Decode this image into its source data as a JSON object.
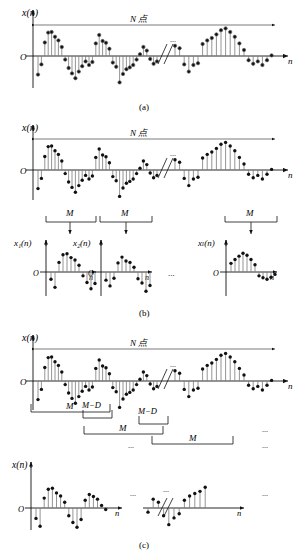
{
  "figure": {
    "title_note": "Segmentation of an N-point sequence x(n)",
    "axis": {
      "signal_label": "x(n)",
      "origin_label": "O",
      "time_label": "n",
      "ellipsis": "...",
      "break_symbol": "//"
    },
    "labels": {
      "n_points": "N 点",
      "M": "M",
      "M_minus_D": "M−D",
      "x1": "x₁(n)",
      "x2": "x₂(n)",
      "xL": "xₗ(n)",
      "x1_sub": "1",
      "x2_sub": "2",
      "xL_sub": "L"
    },
    "captions": {
      "a": "(a)",
      "b": "(b)",
      "c": "(c)"
    }
  },
  "chart_data": {
    "type": "line",
    "xlabel": "n",
    "ylabel": "x(n)",
    "grid": false,
    "legend": "none",
    "panels": [
      {
        "id": "a",
        "caption": "(a)",
        "span_label": "N 点",
        "description": "Full N-point sequence with axis break",
        "ylim": [
          -1,
          1
        ],
        "segments_left": {
          "x": [
            0,
            1,
            2,
            3,
            4,
            5,
            6,
            7,
            8,
            9,
            10,
            11,
            12,
            13,
            14,
            15,
            16,
            17,
            18,
            19,
            20,
            21,
            22,
            23,
            24,
            25,
            26,
            27,
            28,
            29,
            30,
            31,
            32,
            33,
            34,
            35
          ],
          "values": [
            -0.62,
            -0.28,
            0.45,
            0.78,
            0.8,
            0.64,
            0.52,
            0.3,
            -0.12,
            -0.4,
            -0.58,
            -0.74,
            -0.52,
            -0.34,
            -0.18,
            -0.3,
            -0.2,
            0.42,
            0.7,
            0.5,
            0.44,
            0.24,
            -0.22,
            -0.36,
            -0.88,
            -0.6,
            -0.44,
            -0.38,
            -0.3,
            -0.12,
            0.06,
            0.3,
            0.18,
            -0.1,
            -0.26,
            -0.18
          ]
        },
        "segments_right": {
          "x": [
            0,
            1,
            2,
            3,
            4,
            5,
            6,
            7,
            8,
            9,
            10,
            11,
            12,
            13,
            14,
            15,
            16,
            17,
            18,
            19,
            20,
            21
          ],
          "values": [
            0.34,
            0.26,
            -0.28,
            -0.52,
            -0.3,
            -0.24,
            0.4,
            0.52,
            0.6,
            0.72,
            0.86,
            0.92,
            0.8,
            0.64,
            0.42,
            0.2,
            -0.14,
            -0.26,
            -0.18,
            -0.3,
            -0.14,
            0.02
          ]
        }
      },
      {
        "id": "b",
        "caption": "(b)",
        "span_label": "N 点",
        "description": "Non-overlapping segmentation into L blocks of length M",
        "block_label": "M",
        "blocks": [
          {
            "name": "x₁(n)",
            "x": [
              0,
              1,
              2,
              3,
              4,
              5,
              6,
              7,
              8,
              9,
              10,
              11
            ],
            "values": [
              -0.3,
              -0.64,
              0.4,
              0.72,
              0.76,
              0.6,
              0.5,
              0.28,
              -0.16,
              -0.44,
              -0.7,
              -0.48
            ]
          },
          {
            "name": "x₂(n)",
            "x": [
              0,
              1,
              2,
              3,
              4,
              5,
              6,
              7,
              8,
              9,
              10,
              11
            ],
            "values": [
              -0.34,
              -0.58,
              -0.26,
              0.38,
              0.62,
              0.46,
              0.4,
              0.2,
              -0.28,
              -0.46,
              -0.8,
              -0.56
            ]
          },
          {
            "name": "xₗ(n)",
            "x": [
              0,
              1,
              2,
              3,
              4,
              5,
              6,
              7,
              8,
              9,
              10,
              11
            ],
            "values": [
              0.36,
              0.52,
              0.66,
              0.78,
              0.7,
              0.52,
              0.3,
              -0.16,
              -0.24,
              -0.3,
              -0.22,
              -0.1
            ]
          }
        ]
      },
      {
        "id": "c",
        "caption": "(c)",
        "span_label": "N 点",
        "description": "Overlapping segmentation, segment length M with overlap M−D",
        "bracket_labels": [
          "M",
          "M−D",
          "M",
          "M−D",
          "M"
        ],
        "segments_left": {
          "x": [
            0,
            1,
            2,
            3,
            4,
            5,
            6,
            7,
            8,
            9,
            10,
            11,
            12,
            13,
            14,
            15,
            16,
            17,
            18,
            19,
            20,
            21,
            22,
            23,
            24,
            25,
            26,
            27,
            28,
            29,
            30,
            31,
            32,
            33,
            34,
            35
          ],
          "values": [
            -0.62,
            -0.28,
            0.45,
            0.78,
            0.8,
            0.64,
            0.52,
            0.3,
            -0.12,
            -0.4,
            -0.58,
            -0.74,
            -0.52,
            -0.34,
            -0.18,
            -0.3,
            -0.2,
            0.42,
            0.7,
            0.5,
            0.44,
            0.24,
            -0.22,
            -0.36,
            -0.88,
            -0.6,
            -0.44,
            -0.38,
            -0.3,
            -0.12,
            0.06,
            0.3,
            0.18,
            -0.1,
            -0.26,
            -0.18
          ]
        },
        "segments_right": {
          "x": [
            0,
            1,
            2,
            3,
            4,
            5,
            6,
            7,
            8,
            9,
            10,
            11,
            12,
            13,
            14,
            15,
            16,
            17,
            18,
            19,
            20,
            21
          ],
          "values": [
            0.34,
            0.26,
            -0.28,
            -0.52,
            -0.3,
            -0.24,
            0.4,
            0.52,
            0.6,
            0.72,
            0.86,
            0.92,
            0.8,
            0.64,
            0.42,
            0.2,
            -0.14,
            -0.26,
            -0.18,
            -0.3,
            -0.14,
            0.02
          ]
        },
        "extracted_left": {
          "x": [
            0,
            1,
            2,
            3,
            4,
            5,
            6,
            7,
            8,
            9,
            10,
            11,
            12,
            13,
            14,
            15,
            16,
            17,
            18,
            19,
            20
          ],
          "values": [
            -0.4,
            -0.7,
            0.38,
            0.72,
            0.76,
            0.58,
            0.46,
            0.22,
            -0.3,
            -0.56,
            -0.74,
            -0.44,
            0.3,
            0.52,
            0.44,
            0.34,
            0.1,
            -0.06,
            0.0,
            0.0,
            0.0
          ]
        },
        "extracted_right": {
          "x": [
            0,
            1,
            2,
            3,
            4,
            5,
            6,
            7,
            8,
            9,
            10,
            11,
            12,
            13,
            14
          ],
          "values": [
            -0.16,
            0.34,
            0.22,
            -0.3,
            -0.64,
            -0.38,
            -0.22,
            0.3,
            0.46,
            0.56,
            0.64,
            0.8,
            0.0,
            0.0,
            0.0
          ]
        }
      }
    ]
  }
}
